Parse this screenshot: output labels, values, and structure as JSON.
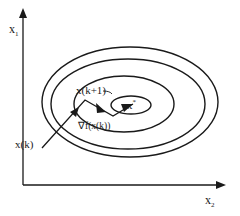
{
  "diagram": {
    "axes": {
      "y_label": "x",
      "y_sub": "1",
      "x_label": "x",
      "x_sub": "2"
    },
    "labels": {
      "current_point": "x(k)",
      "next_point": "x(k+1)",
      "gradient": "∇f(x(k))",
      "optimum": "x",
      "optimum_sup": "*"
    },
    "contours": 4,
    "colors": {
      "stroke": "#1a1a1a",
      "background": "#ffffff"
    }
  }
}
